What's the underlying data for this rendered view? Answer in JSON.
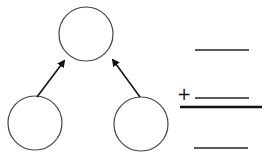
{
  "diagram": {
    "type": "number-bond",
    "circles": [
      {
        "role": "whole",
        "value": ""
      },
      {
        "role": "part-left",
        "value": ""
      },
      {
        "role": "part-right",
        "value": ""
      }
    ],
    "arrows": [
      "part-left -> whole",
      "part-right -> whole"
    ]
  },
  "addition": {
    "operator": "+",
    "addend_1": "",
    "addend_2": "",
    "sum": ""
  },
  "colors": {
    "stroke": "#333333",
    "background": "#ffffff"
  }
}
